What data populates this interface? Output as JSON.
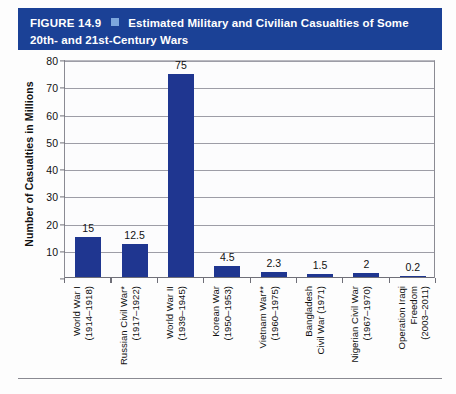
{
  "banner": {
    "figure_number": "FIGURE 14.9",
    "separator_icon": "blue-square-icon",
    "title_line1": "Estimated Military and Civilian Casualties of Some",
    "title_line2": "20th- and 21st-Century Wars",
    "background_color": "#1b4196",
    "text_color": "#ffffff",
    "square_color": "#7da7dd"
  },
  "chart_data": {
    "type": "bar",
    "title": "Estimated Military and Civilian Casualties of Some 20th- and 21st-Century Wars",
    "xlabel": "",
    "ylabel": "Number of Casualties in Millions",
    "ylim": [
      0,
      80
    ],
    "yticks": [
      0,
      10,
      20,
      30,
      40,
      50,
      60,
      70,
      80
    ],
    "ytick_labels": [
      "",
      "10",
      "20",
      "30",
      "40",
      "50",
      "60",
      "70",
      "80"
    ],
    "grid": true,
    "legend": "none",
    "bar_color": "#1f3690",
    "categories": [
      "World War I (1914–1918)",
      "Russian Civil War* (1917–1922)",
      "World War II (1939–1945)",
      "Korean War (1950–1953)",
      "Vietnam War** (1960–1975)",
      "Bangladesh Civil War (1971)",
      "Nigerian Civil War (1967–1970)",
      "Operation Iraqi Freedom (2003–2011)"
    ],
    "values": [
      15,
      12.5,
      75,
      4.5,
      2.3,
      1.5,
      2,
      0.2
    ],
    "data_labels": [
      "15",
      "12.5",
      "75",
      "4.5",
      "2.3",
      "1.5",
      "2",
      "0.2"
    ],
    "category_label_lines": [
      [
        "World War I",
        "(1914–1918)"
      ],
      [
        "Russian Civil War*",
        "(1917–1922)"
      ],
      [
        "World War II",
        "(1939–1945)"
      ],
      [
        "Korean War",
        "(1950–1953)"
      ],
      [
        "Vietnam War**",
        "(1960–1975)"
      ],
      [
        "Bangladesh",
        "Civil War (1971)"
      ],
      [
        "Nigerian Civil War",
        "(1967–1970)"
      ],
      [
        "Operation Iraqi",
        "Freedom",
        "(2003–2011)"
      ]
    ]
  }
}
